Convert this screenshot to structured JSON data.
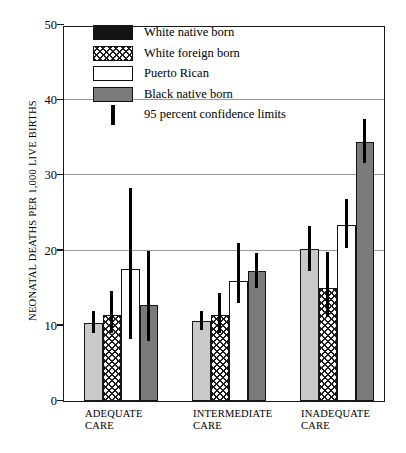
{
  "chart_data": {
    "type": "bar",
    "title": "",
    "xlabel": "",
    "ylabel": "NEONATAL DEATHS PER 1,000 LIVE BIRTHS",
    "ylim": [
      0,
      50
    ],
    "yticks": [
      0,
      10,
      20,
      30,
      40,
      50
    ],
    "grid": "horizontal gridlines at 20, 30, 40",
    "legend_position": "top-center inside plot",
    "categories": [
      "ADEQUATE\nCARE",
      "INTERMEDIATE\nCARE",
      "INADEQUATE\nCARE"
    ],
    "series": [
      {
        "name": "White native born",
        "swatch": "black",
        "bar_fill": "light-gray",
        "values": [
          10.4,
          10.6,
          20.2
        ],
        "ci_low": [
          9.0,
          9.4,
          17.3
        ],
        "ci_high": [
          12.0,
          12.0,
          23.3
        ]
      },
      {
        "name": "White foreign born",
        "swatch": "checkered",
        "bar_fill": "checkered",
        "values": [
          11.5,
          11.5,
          15.0
        ],
        "ci_low": [
          9.0,
          9.0,
          11.2
        ],
        "ci_high": [
          14.6,
          14.4,
          19.8
        ]
      },
      {
        "name": "Puerto Rican",
        "swatch": "white",
        "bar_fill": "white",
        "values": [
          17.6,
          16.0,
          23.4
        ],
        "ci_low": [
          8.2,
          13.0,
          20.4
        ],
        "ci_high": [
          28.3,
          21.0,
          26.9
        ]
      },
      {
        "name": "Black native born",
        "swatch": "dark-gray",
        "bar_fill": "dark-gray",
        "values": [
          12.8,
          17.3,
          34.5
        ],
        "ci_low": [
          8.0,
          15.0,
          31.6
        ],
        "ci_high": [
          20.0,
          19.7,
          37.5
        ]
      }
    ],
    "error_bar_note": "95 percent confidence limits"
  },
  "legend": {
    "items": [
      {
        "label": "White native born"
      },
      {
        "label": "White foreign born"
      },
      {
        "label": "Puerto Rican"
      },
      {
        "label": "Black native born"
      },
      {
        "label": "95 percent confidence limits"
      }
    ]
  },
  "axis": {
    "y_title": "NEONATAL DEATHS PER 1,000 LIVE BIRTHS",
    "ticks": [
      "50",
      "40",
      "30",
      "20",
      "10",
      "0"
    ]
  },
  "groups": [
    {
      "line1": "ADEQUATE",
      "line2": "CARE"
    },
    {
      "line1": "INTERMEDIATE",
      "line2": "CARE"
    },
    {
      "line1": "INADEQUATE",
      "line2": "CARE"
    }
  ],
  "colors": {
    "light_gray": "#c9c9c9",
    "dark_gray": "#7b7b7b",
    "white": "#ffffff",
    "ink": "#151515",
    "gridline": "#9a9a9a"
  }
}
